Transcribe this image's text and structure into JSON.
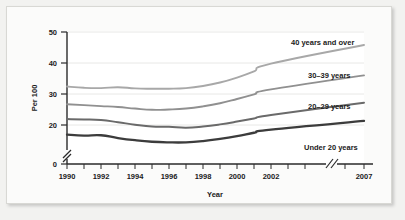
{
  "chart_data": {
    "type": "line",
    "title": "",
    "xlabel": "Year",
    "ylabel": "Per 100",
    "xlim": [
      1990,
      2007
    ],
    "ylim": [
      0,
      50
    ],
    "y_ticks": [
      0,
      20,
      30,
      40,
      50
    ],
    "y_tick_labels": [
      "0",
      "20",
      "30",
      "40",
      "50"
    ],
    "y_axis_break": true,
    "y_axis_break_between": [
      0,
      20
    ],
    "x_ticks": [
      1990,
      1991,
      1992,
      1993,
      1994,
      1995,
      1996,
      1997,
      1998,
      1999,
      2000,
      2001,
      2002,
      2007
    ],
    "x_tick_labels": [
      "1990",
      "",
      "1992",
      "",
      "1994",
      "",
      "1996",
      "",
      "1998",
      "",
      "2000",
      "",
      "2002",
      "2007"
    ],
    "x_axis_break": true,
    "x_axis_break_between": [
      2002,
      2007
    ],
    "grid": true,
    "legend_position": "inline-right",
    "x": [
      1990,
      1991,
      1992,
      1993,
      1994,
      1995,
      1996,
      1997,
      1998,
      1999,
      2000,
      2001,
      2002,
      2007
    ],
    "series": [
      {
        "name": "40 years and over",
        "label": "40 years and over",
        "color": "#a8a8a8",
        "values": [
          32.4,
          32.0,
          31.9,
          32.2,
          31.8,
          31.7,
          31.7,
          31.9,
          32.6,
          33.7,
          35.3,
          37.3,
          39.8,
          45.8
        ]
      },
      {
        "name": "30-39 years",
        "label": "30–39 years",
        "color": "#909090",
        "values": [
          26.7,
          26.4,
          26.1,
          25.8,
          25.3,
          24.9,
          25.0,
          25.3,
          26.0,
          27.0,
          28.4,
          29.9,
          31.5,
          36.0
        ]
      },
      {
        "name": "20-29 years",
        "label": "20–29 years",
        "color": "#6a6a6a",
        "values": [
          21.9,
          21.8,
          21.6,
          20.9,
          20.1,
          19.5,
          19.4,
          19.1,
          19.5,
          20.2,
          21.1,
          22.1,
          23.2,
          27.2
        ]
      },
      {
        "name": "Under 20 years",
        "label": "Under 20 years",
        "color": "#3c3c3c",
        "values": [
          16.9,
          16.6,
          16.7,
          15.8,
          15.1,
          14.6,
          14.4,
          14.4,
          14.8,
          15.5,
          16.4,
          17.5,
          18.5,
          21.3
        ]
      }
    ],
    "series_label_positions": [
      {
        "label": "40 years and over",
        "x": 284,
        "y": 38
      },
      {
        "label": "30–39 years",
        "x": 301,
        "y": 71
      },
      {
        "label": "20–29 years",
        "x": 301,
        "y": 102
      },
      {
        "label": "Under 20 years",
        "x": 297,
        "y": 143
      }
    ]
  }
}
